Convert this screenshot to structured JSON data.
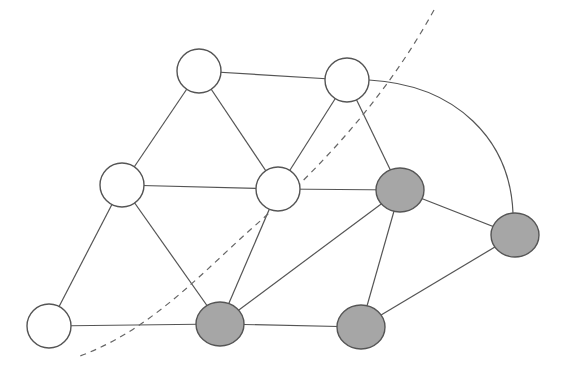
{
  "diagram": {
    "type": "graph-cut",
    "colors": {
      "edge": "#555555",
      "node_stroke": "#555555",
      "white_fill": "#ffffff",
      "gray_fill": "#a6a6a6",
      "cut_line": "#666666"
    },
    "nodes": [
      {
        "id": "A",
        "x": 199,
        "y": 71,
        "rx": 22,
        "ry": 22,
        "group": "white"
      },
      {
        "id": "B",
        "x": 347,
        "y": 80,
        "rx": 22,
        "ry": 22,
        "group": "white"
      },
      {
        "id": "C",
        "x": 122,
        "y": 185,
        "rx": 22,
        "ry": 22,
        "group": "white"
      },
      {
        "id": "D",
        "x": 278,
        "y": 189,
        "rx": 22,
        "ry": 22,
        "group": "white"
      },
      {
        "id": "E",
        "x": 400,
        "y": 190,
        "rx": 24,
        "ry": 22,
        "group": "gray"
      },
      {
        "id": "F",
        "x": 515,
        "y": 235,
        "rx": 24,
        "ry": 22,
        "group": "gray"
      },
      {
        "id": "G",
        "x": 49,
        "y": 326,
        "rx": 22,
        "ry": 22,
        "group": "white"
      },
      {
        "id": "H",
        "x": 220,
        "y": 324,
        "rx": 24,
        "ry": 22,
        "group": "gray"
      },
      {
        "id": "I",
        "x": 361,
        "y": 327,
        "rx": 24,
        "ry": 22,
        "group": "gray"
      }
    ],
    "edges": [
      {
        "from": "A",
        "to": "B"
      },
      {
        "from": "A",
        "to": "C"
      },
      {
        "from": "A",
        "to": "D"
      },
      {
        "from": "B",
        "to": "D"
      },
      {
        "from": "B",
        "to": "E"
      },
      {
        "from": "B",
        "to": "F",
        "curved": true
      },
      {
        "from": "C",
        "to": "D"
      },
      {
        "from": "C",
        "to": "G"
      },
      {
        "from": "C",
        "to": "H"
      },
      {
        "from": "D",
        "to": "E"
      },
      {
        "from": "D",
        "to": "H"
      },
      {
        "from": "E",
        "to": "H"
      },
      {
        "from": "E",
        "to": "I"
      },
      {
        "from": "E",
        "to": "F"
      },
      {
        "from": "F",
        "to": "I"
      },
      {
        "from": "G",
        "to": "H"
      },
      {
        "from": "H",
        "to": "I"
      }
    ],
    "cut_curve": {
      "style": "dashed",
      "path": "M 434 10 C 390 90, 330 160, 250 230 C 200 275, 150 330, 80 356"
    }
  }
}
